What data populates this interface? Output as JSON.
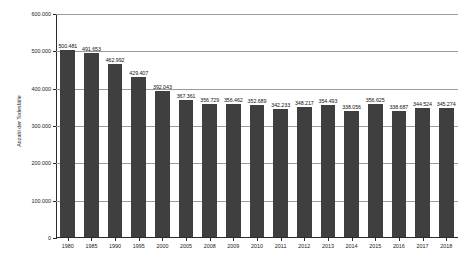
{
  "chart_data": {
    "type": "bar",
    "title": "",
    "xlabel": "",
    "ylabel": "Anzahl der Todesfälle",
    "ylim": [
      0,
      600000
    ],
    "yticks": [
      0,
      100000,
      200000,
      300000,
      400000,
      500000,
      600000
    ],
    "ytick_labels": [
      "0",
      "100.000",
      "200.000",
      "300.000",
      "400.000",
      "500.000",
      "600.000"
    ],
    "grid": true,
    "legend": "none",
    "bar_color": "#3f3f3f",
    "categories": [
      "1980",
      "1985",
      "1990",
      "1995",
      "2000",
      "2005",
      "2008",
      "2009",
      "2010",
      "2011",
      "2012",
      "2013",
      "2014",
      "2015",
      "2016",
      "2017",
      "2018"
    ],
    "values": [
      500481,
      491653,
      462992,
      429407,
      392043,
      367361,
      356729,
      356462,
      352689,
      342233,
      348217,
      354493,
      338056,
      356625,
      338687,
      344524,
      345274
    ],
    "data_labels": [
      "500.481",
      "491.653",
      "462.992",
      "429.407",
      "392.043",
      "367.361",
      "356.729",
      "356.462",
      "352.689",
      "342.233",
      "348.217",
      "354.493",
      "338.056",
      "356.625",
      "338.687",
      "344.524",
      "345.274"
    ]
  }
}
